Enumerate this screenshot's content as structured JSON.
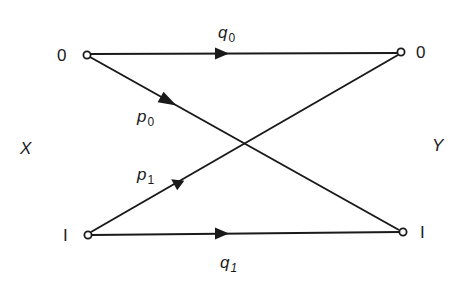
{
  "diagram": {
    "type": "binary-channel-transition-diagram",
    "input_label": "X",
    "output_label": "Y",
    "input_nodes": [
      {
        "label": "0"
      },
      {
        "label": "I"
      }
    ],
    "output_nodes": [
      {
        "label": "0"
      },
      {
        "label": "I"
      }
    ],
    "edges": [
      {
        "from": "X:0",
        "to": "Y:0",
        "symbol": "q",
        "subscript": "0"
      },
      {
        "from": "X:0",
        "to": "Y:1",
        "symbol": "p",
        "subscript": "0"
      },
      {
        "from": "X:1",
        "to": "Y:0",
        "symbol": "p",
        "subscript": "1"
      },
      {
        "from": "X:1",
        "to": "Y:1",
        "symbol": "q",
        "subscript": "1"
      }
    ],
    "colors": {
      "line": "#1a1a1a",
      "background": "#ffffff"
    }
  }
}
